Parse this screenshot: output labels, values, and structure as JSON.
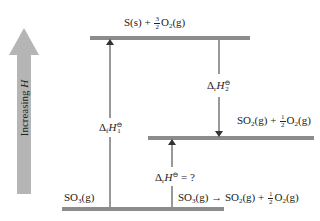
{
  "diagram": {
    "type": "enthalpy-level-diagram",
    "axis_label": {
      "text": "Increasing ",
      "var": "H"
    },
    "colors": {
      "level_bar": "#8c8c8c",
      "axis_arrow": "#b5b5b5",
      "line": "#333333"
    },
    "levels": [
      {
        "id": "top",
        "species": "S(s) + 3/2 O2(g)",
        "prefix": "S(s) +",
        "coef_num": "3",
        "coef_den": "2",
        "species_main": "O",
        "sub": "2",
        "suffix": "(g)"
      },
      {
        "id": "middle",
        "species": "SO2(g) + 1/2 O2(g)",
        "a_main": "SO",
        "a_sub": "2",
        "a_suffix": "(g) +",
        "coef_num": "1",
        "coef_den": "2",
        "b_main": "O",
        "b_sub": "2",
        "b_suffix": "(g)"
      },
      {
        "id": "bottom",
        "species": "SO3(g)",
        "main": "SO",
        "sub": "3",
        "suffix": "(g)"
      }
    ],
    "arrows": [
      {
        "id": "dH1",
        "label": "ΔfH°1",
        "delta": "Δ",
        "sub1": "f",
        "var": "H",
        "sup": "⊖",
        "sub2": "1",
        "direction": "up",
        "from": "bottom",
        "to": "top"
      },
      {
        "id": "dH2",
        "label": "ΔrH°2",
        "delta": "Δ",
        "sub1": "r",
        "var": "H",
        "sup": "⊖",
        "sub2": "2",
        "direction": "down",
        "from": "top",
        "to": "middle"
      },
      {
        "id": "dH",
        "label": "ΔrH° = ?",
        "delta": "Δ",
        "sub1": "r",
        "var": "H",
        "sup": "⊖",
        "tail": "= ?",
        "direction": "up",
        "from": "bottom",
        "to": "middle"
      }
    ],
    "reaction": {
      "text": "SO3(g) → SO2(g) + 1/2 O2(g)",
      "r_main": "SO",
      "r_sub": "3",
      "r_suffix": "(g)",
      "arrow": "→",
      "p_main": "SO",
      "p_sub": "2",
      "p_suffix": "(g) +",
      "coef_num": "1",
      "coef_den": "2",
      "o_main": "O",
      "o_sub": "2",
      "o_suffix": "(g)"
    }
  }
}
